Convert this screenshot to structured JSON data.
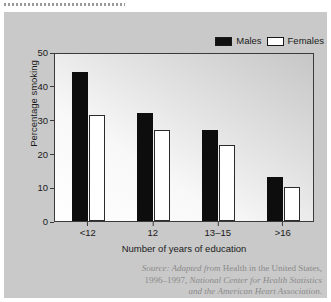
{
  "figure": {
    "legend": {
      "position": "top-right",
      "entries": [
        {
          "label": "Males",
          "swatch": "filled-black-square",
          "color": "#101010"
        },
        {
          "label": "Females",
          "swatch": "outlined-white-square",
          "color": "#ffffff"
        }
      ]
    },
    "source": {
      "prefix": "Source: Adapted from",
      "work": "Health in the United States,",
      "years": "1996–1997,",
      "publisher": "National Center for Health Statistics",
      "and": "and the American Heart Association."
    }
  },
  "chart_data": {
    "type": "bar",
    "title": "",
    "xlabel": "Number of years of education",
    "ylabel": "Percentage smoking",
    "categories": [
      "<12",
      "12",
      "13–15",
      ">16"
    ],
    "series": [
      {
        "name": "Males",
        "values": [
          44,
          32,
          27,
          13
        ]
      },
      {
        "name": "Females",
        "values": [
          31.5,
          27,
          22.5,
          10
        ]
      }
    ],
    "ylim": [
      0,
      50
    ],
    "yticks": [
      0,
      10,
      20,
      30,
      40,
      50
    ],
    "grid": false,
    "legend_position": "top-right"
  },
  "colors": {
    "panel_background": "#c9c9c9",
    "plot_background": "#eaeaea",
    "axis": "#3a3a3a",
    "males": "#101010",
    "females": "#ffffff",
    "caption": "#8a8a8a"
  }
}
